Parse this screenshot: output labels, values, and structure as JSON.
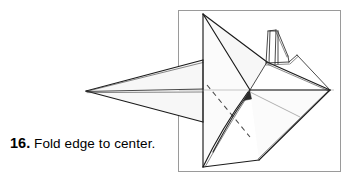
{
  "page": {
    "background_color": "#ffffff",
    "width": 358,
    "height": 181
  },
  "caption": {
    "name": "step-caption",
    "step_number": "16.",
    "instruction": "Fold edge to center."
  },
  "figure": {
    "name": "origami-step-diagram",
    "alt_label": "Origami model with long pointed nose, vertical fin, dashed fold line and curved fold arrow",
    "frame": {
      "x": 178,
      "y": 10,
      "width": 163,
      "height": 162,
      "stroke_color": "#9a9a9a",
      "fill_color": "#ffffff"
    },
    "colors": {
      "edge": "#1a1a1a",
      "edge_thin": "#2a2a2a",
      "centerline": "#b9b9b9",
      "fold_dashed": "#4a4a4a",
      "arrow": "#2b2b2b",
      "arrow_reference": "#9d9d9d",
      "paper_face": "#fdfdfd"
    },
    "annotations": {
      "fold_line_style": "dashed",
      "arrow_style": "curved-valley-fold",
      "arrow_direction": "up-left-to-center"
    }
  }
}
